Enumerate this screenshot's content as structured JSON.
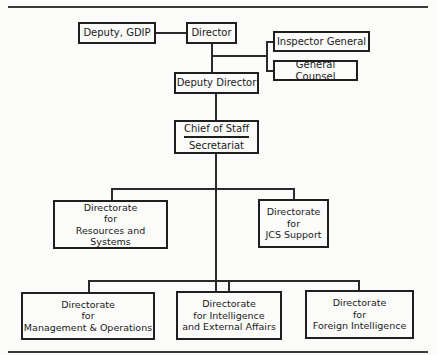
{
  "diagram": {
    "type": "org-chart",
    "nodes": {
      "deputy_gdip": {
        "label": "Deputy, GDIP"
      },
      "director": {
        "label": "Director"
      },
      "inspector_general": {
        "label": "Inspector General"
      },
      "general_counsel": {
        "label": "General Counsel"
      },
      "deputy_director": {
        "label": "Deputy Director"
      },
      "chief_of_staff": {
        "label": "Chief of Staff",
        "sublabel": "Secretariat"
      },
      "dir_resources": {
        "lines": [
          "Directorate",
          "for",
          "Resources and Systems"
        ]
      },
      "dir_jcs": {
        "lines": [
          "Directorate",
          "for",
          "JCS Support"
        ]
      },
      "dir_management": {
        "lines": [
          "Directorate",
          "for",
          "Management & Operations"
        ]
      },
      "dir_intel_external": {
        "lines": [
          "Directorate",
          "for Intelligence",
          "and External Affairs"
        ]
      },
      "dir_foreign": {
        "lines": [
          "Directorate",
          "for",
          "Foreign Intelligence"
        ]
      }
    },
    "edges": [
      [
        "deputy_gdip",
        "director"
      ],
      [
        "director",
        "inspector_general"
      ],
      [
        "director",
        "general_counsel"
      ],
      [
        "director",
        "deputy_director"
      ],
      [
        "deputy_director",
        "chief_of_staff"
      ],
      [
        "chief_of_staff",
        "dir_resources"
      ],
      [
        "chief_of_staff",
        "dir_jcs"
      ],
      [
        "chief_of_staff",
        "dir_management"
      ],
      [
        "chief_of_staff",
        "dir_intel_external"
      ],
      [
        "chief_of_staff",
        "dir_foreign"
      ]
    ]
  }
}
